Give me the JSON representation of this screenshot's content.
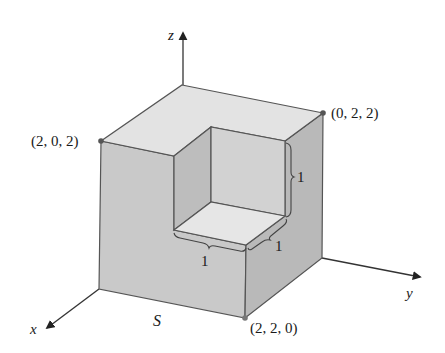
{
  "figure": {
    "surface_label": "S",
    "axes": {
      "x_label": "x",
      "y_label": "y",
      "z_label": "z"
    },
    "points": [
      {
        "id": "p202",
        "label": "(2, 0, 2)"
      },
      {
        "id": "p022",
        "label": "(0, 2, 2)"
      },
      {
        "id": "p220",
        "label": "(2, 2, 0)"
      }
    ],
    "dimension_labels": [
      {
        "id": "notch-height",
        "label": "1"
      },
      {
        "id": "notch-depth-right",
        "label": "1"
      },
      {
        "id": "notch-width-front",
        "label": "1"
      }
    ],
    "colors": {
      "top_face": "#e3e3e3",
      "left_face": "#c9c9c9",
      "right_face": "#b9b9b9",
      "notch_back_wall": "#d2d2d2",
      "notch_left_wall": "#bdbdbd",
      "notch_floor": "#e6e6e6",
      "edge": "#555555",
      "axis": "#333333"
    }
  }
}
